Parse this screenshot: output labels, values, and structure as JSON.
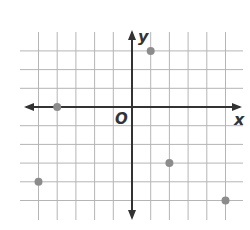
{
  "diagram": {
    "type": "coordinate-plane",
    "axes": {
      "x_label": "x",
      "y_label": "y",
      "origin_label": "O"
    },
    "grid": {
      "x_min": -5,
      "x_max": 5,
      "y_min": -6,
      "y_max": 4,
      "step": 1
    },
    "points": [
      {
        "x": 1,
        "y": 3
      },
      {
        "x": -4,
        "y": 0
      },
      {
        "x": -5,
        "y": -4
      },
      {
        "x": 2,
        "y": -3
      },
      {
        "x": 5,
        "y": -5
      }
    ],
    "colors": {
      "grid": "#b5b5b5",
      "axis": "#333333",
      "point": "#8c8c8c"
    }
  }
}
